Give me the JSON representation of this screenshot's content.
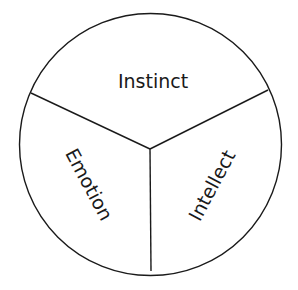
{
  "diagram": {
    "type": "three-segment circle",
    "colors": {
      "stroke": "#1a1a1a",
      "background": "#ffffff",
      "text": "#1a1a1a"
    },
    "segments": [
      {
        "id": "top",
        "label": "Instinct"
      },
      {
        "id": "left",
        "label": "Emotion"
      },
      {
        "id": "right",
        "label": "Intellect"
      }
    ]
  }
}
